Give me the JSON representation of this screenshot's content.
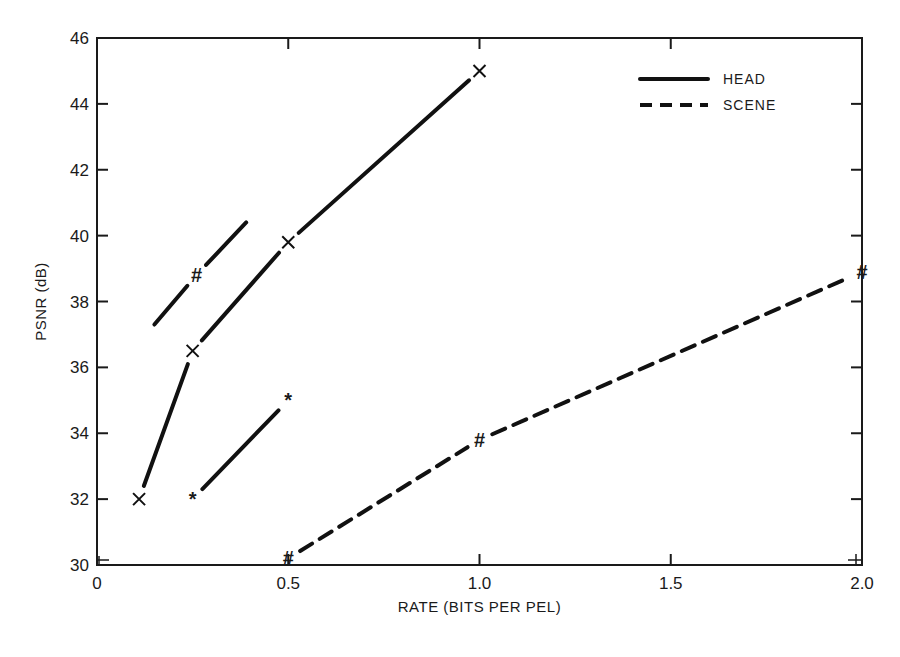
{
  "chart_data": {
    "type": "line",
    "title": "",
    "xlabel": "RATE (BITS PER PEL)",
    "ylabel": "PSNR (dB)",
    "xlim": [
      0,
      2.0
    ],
    "ylim": [
      30,
      46
    ],
    "x_ticks": [
      "0",
      "0.5",
      "1.0",
      "1.5",
      "2.0"
    ],
    "y_ticks": [
      "30",
      "32",
      "34",
      "36",
      "38",
      "40",
      "42",
      "44",
      "46"
    ],
    "grid": false,
    "legend_position": "upper right",
    "legend": [
      {
        "label": "HEAD",
        "style": "solid"
      },
      {
        "label": "SCENE",
        "style": "dashed"
      }
    ],
    "series": [
      {
        "name": "HEAD (x)",
        "style": "solid",
        "marker": "x",
        "x": [
          0.11,
          0.25,
          0.5,
          1.0
        ],
        "y": [
          32.0,
          36.5,
          39.8,
          45.0
        ]
      },
      {
        "name": "HEAD (*)",
        "style": "solid",
        "marker": "*",
        "x": [
          0.25,
          0.5
        ],
        "y": [
          32.0,
          35.0
        ]
      },
      {
        "name": "HEAD (#)",
        "style": "solid",
        "marker": "#",
        "x": [
          0.15,
          0.26,
          0.39
        ],
        "y": [
          37.3,
          38.8,
          40.4
        ],
        "marker_index": [
          1
        ]
      },
      {
        "name": "SCENE (#)",
        "style": "dashed",
        "marker": "#",
        "x": [
          0.5,
          1.0,
          2.0
        ],
        "y": [
          30.2,
          33.8,
          38.9
        ]
      }
    ]
  },
  "axes": {
    "xlabel": "RATE (BITS PER PEL)",
    "ylabel": "PSNR (dB)",
    "x_ticks": [
      "0",
      "0.5",
      "1.0",
      "1.5",
      "2.0"
    ],
    "y_ticks": [
      "30",
      "32",
      "34",
      "36",
      "38",
      "40",
      "42",
      "44",
      "46"
    ]
  },
  "legend": {
    "head": "HEAD",
    "scene": "SCENE"
  }
}
